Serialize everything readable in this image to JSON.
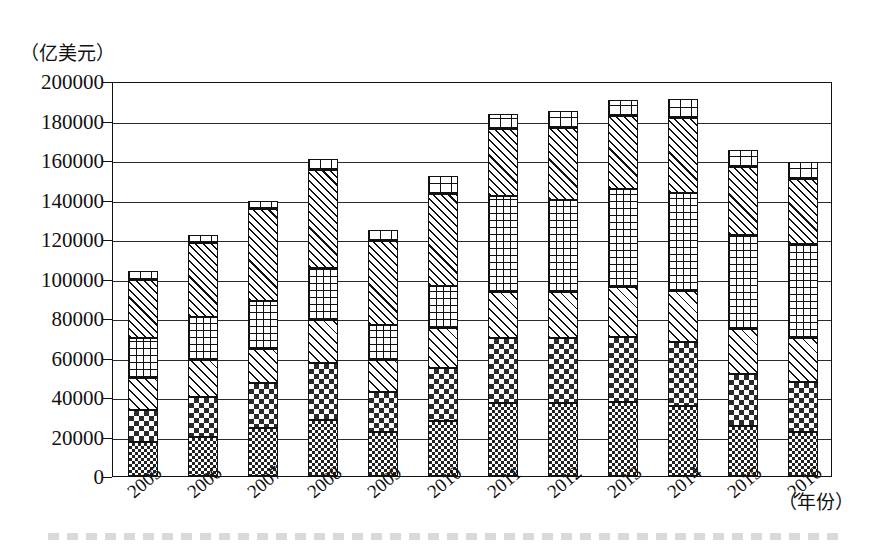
{
  "chart_data": {
    "type": "bar",
    "stacked": true,
    "title": "",
    "xlabel": "（年份）",
    "ylabel": "（亿美元）",
    "ylim": [
      0,
      200000
    ],
    "ytick_step": 20000,
    "yticks": [
      "0",
      "20000",
      "40000",
      "60000",
      "80000",
      "100000",
      "120000",
      "140000",
      "160000",
      "180000",
      "200000"
    ],
    "grid": true,
    "legend_position": "none",
    "categories": [
      "2005",
      "2006",
      "2007",
      "2008",
      "2009",
      "2010",
      "2011",
      "2012",
      "2013",
      "2014",
      "2015",
      "2016"
    ],
    "series": [
      {
        "name": "series-1",
        "pattern": "fine-checker",
        "values": [
          17000,
          20000,
          24500,
          28500,
          22500,
          28000,
          37000,
          37000,
          37500,
          35500,
          25500,
          22500
        ]
      },
      {
        "name": "series-2",
        "pattern": "coarse-checker",
        "values": [
          16500,
          20000,
          22500,
          28500,
          20000,
          26500,
          33000,
          33000,
          33000,
          32500,
          26000,
          25000
        ]
      },
      {
        "name": "series-3",
        "pattern": "diagonal-hatch",
        "values": [
          16000,
          18500,
          17500,
          22000,
          16000,
          20500,
          23000,
          23000,
          25000,
          25500,
          23000,
          22500
        ]
      },
      {
        "name": "series-4",
        "pattern": "square-grid",
        "values": [
          20500,
          22000,
          24000,
          26500,
          18000,
          21000,
          49000,
          47000,
          50000,
          50000,
          47500,
          47500
        ]
      },
      {
        "name": "series-5",
        "pattern": "dense-diagonal",
        "values": [
          29500,
          37500,
          46500,
          49500,
          42500,
          47000,
          33500,
          36000,
          37000,
          38000,
          34500,
          33000
        ]
      },
      {
        "name": "series-6",
        "pattern": "brick-cap",
        "values": [
          4500,
          4000,
          4500,
          5500,
          5500,
          9000,
          8000,
          9000,
          8000,
          9500,
          8500,
          8500
        ]
      }
    ],
    "totals": [
      104000,
      122000,
      139500,
      160500,
      124500,
      152000,
      183500,
      185000,
      190500,
      191000,
      165000,
      159000
    ]
  }
}
